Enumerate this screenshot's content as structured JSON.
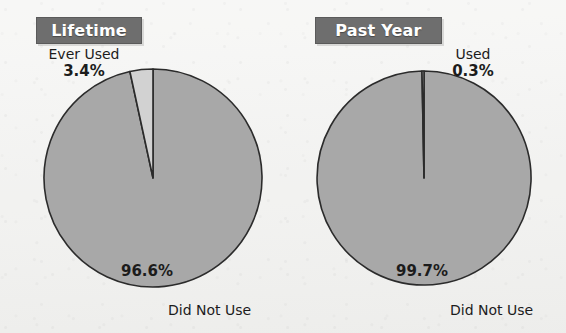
{
  "figure": {
    "background_color": "#f2f2f0",
    "panel_count": 2
  },
  "colors": {
    "title_bar_bg": "#6e6e6e",
    "title_bar_text": "#ffffff",
    "slice_major": "#a8a8a8",
    "slice_minor": "#d2d2d2",
    "outline": "#2b2b2b",
    "label_text": "#1c1c1c"
  },
  "panels": [
    {
      "key": "lifetime",
      "title": "Lifetime",
      "callout_category": "Ever Used",
      "callout_percent": "3.4%",
      "inner_percent": "96.6%",
      "bottom_label": "Did Not Use"
    },
    {
      "key": "past_year",
      "title": "Past Year",
      "callout_category": "Used",
      "callout_percent": "0.3%",
      "inner_percent": "99.7%",
      "bottom_label": "Did Not Use"
    }
  ],
  "chart_data": [
    {
      "type": "pie",
      "title": "Lifetime",
      "categories": [
        "Ever Used",
        "Did Not Use"
      ],
      "values": [
        3.4,
        96.6
      ],
      "labels": [
        "3.4%",
        "96.6%"
      ],
      "colors": [
        "#d2d2d2",
        "#a8a8a8"
      ],
      "units": "percent",
      "start_angle_deg": 0,
      "direction": "counterclockwise",
      "legend": "none",
      "grid": false,
      "xlabel": "",
      "ylabel": ""
    },
    {
      "type": "pie",
      "title": "Past Year",
      "categories": [
        "Used",
        "Did Not Use"
      ],
      "values": [
        0.3,
        99.7
      ],
      "labels": [
        "0.3%",
        "99.7%"
      ],
      "colors": [
        "#d2d2d2",
        "#a8a8a8"
      ],
      "units": "percent",
      "start_angle_deg": 0,
      "direction": "counterclockwise",
      "legend": "none",
      "grid": false,
      "xlabel": "",
      "ylabel": ""
    }
  ]
}
